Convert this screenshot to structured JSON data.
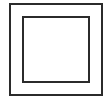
{
  "diagram": {
    "type": "nested-squares",
    "background": "#ffffff",
    "stroke_color": "#2b2b2b",
    "outer_square": {
      "x": 9,
      "y": 3,
      "width": 94,
      "height": 93,
      "stroke_width": 2
    },
    "inner_square": {
      "x": 22,
      "y": 16,
      "width": 68,
      "height": 67,
      "stroke_width": 2
    }
  }
}
